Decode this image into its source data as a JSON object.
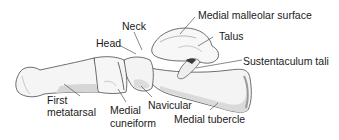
{
  "diagram": {
    "colors": {
      "bone_fill": "#f4f4f4",
      "bone_shade": "#d9d9d9",
      "bone_dark": "#bdbdbd",
      "outline": "#4a4a4a",
      "leader": "#555555",
      "text": "#1a1a1a"
    },
    "labels": [
      {
        "id": "neck",
        "text": "Neck"
      },
      {
        "id": "medial-malleolar-surface",
        "text": "Medial malleolar surface"
      },
      {
        "id": "head",
        "text": "Head"
      },
      {
        "id": "talus",
        "text": "Talus"
      },
      {
        "id": "sustentaculum-tali",
        "text": "Sustentaculum tali"
      },
      {
        "id": "first-metatarsal-line1",
        "text": "First"
      },
      {
        "id": "first-metatarsal-line2",
        "text": "metatarsal"
      },
      {
        "id": "medial-cuneiform-line1",
        "text": "Medial"
      },
      {
        "id": "medial-cuneiform-line2",
        "text": "cuneiform"
      },
      {
        "id": "navicular",
        "text": "Navicular"
      },
      {
        "id": "medial-tubercle",
        "text": "Medial tubercle"
      }
    ]
  }
}
